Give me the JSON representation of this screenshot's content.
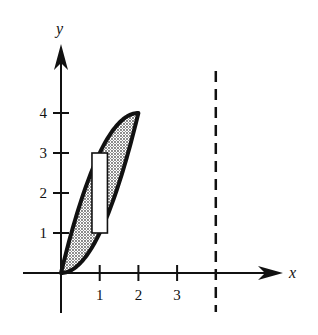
{
  "diagram": {
    "x_axis_label": "x",
    "y_axis_label": "y",
    "x_ticks": [
      {
        "value": 1,
        "label": "1"
      },
      {
        "value": 2,
        "label": "2"
      },
      {
        "value": 3,
        "label": "3"
      }
    ],
    "y_ticks": [
      {
        "value": 1,
        "label": "1"
      },
      {
        "value": 2,
        "label": "2"
      },
      {
        "value": 3,
        "label": "3"
      },
      {
        "value": 4,
        "label": "4"
      }
    ],
    "region": {
      "description": "Shaded region between y = 4x - x^2 (upper) and y = x^2 (lower), 0 <= x <= 2",
      "upper_curve": "y = 4x - x^2",
      "lower_curve": "y = x^2",
      "x_range": [
        0,
        2
      ],
      "fill": "dotted-gray"
    },
    "representative_rectangle": {
      "x_center": 1,
      "x_range": [
        0.8,
        1.2
      ],
      "y_range": [
        1,
        3
      ]
    },
    "axis_of_revolution": {
      "type": "vertical-dashed-line",
      "x": 4
    },
    "x_range": [
      -1,
      5.5
    ],
    "y_range": [
      -1,
      5.8
    ]
  }
}
